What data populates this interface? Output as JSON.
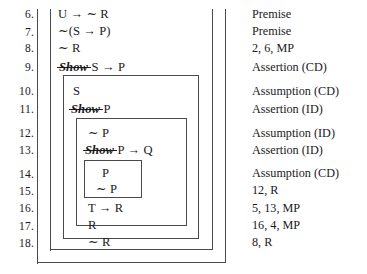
{
  "figure": {
    "ink_color": "#1a1a1a",
    "rule_color": "#4a4a4a"
  },
  "proof": {
    "lines": [
      {
        "number": "6.",
        "show": "",
        "formula": "U → ∼ R",
        "justification": "Premise"
      },
      {
        "number": "7.",
        "show": "",
        "formula": "∼(S → P)",
        "justification": "Premise"
      },
      {
        "number": "8.",
        "show": "",
        "formula": "∼ R",
        "justification": "2, 6, MP"
      },
      {
        "number": "9.",
        "show": "Show",
        "formula": "S → P",
        "justification": "Assertion (CD)"
      },
      {
        "number": "10.",
        "show": "",
        "formula": "S",
        "justification": "Assumption (CD)"
      },
      {
        "number": "11.",
        "show": "Show",
        "formula": "P",
        "justification": "Assertion (ID)"
      },
      {
        "number": "12.",
        "show": "",
        "formula": "∼ P",
        "justification": "Assumption (ID)"
      },
      {
        "number": "13.",
        "show": "Show",
        "formula": "P → Q",
        "justification": "Assertion (ID)"
      },
      {
        "number": "14.",
        "show": "",
        "formula": "P",
        "justification": "Assumption (CD)"
      },
      {
        "number": "15.",
        "show": "",
        "formula": "∼ P",
        "justification": "12, R"
      },
      {
        "number": "16.",
        "show": "",
        "formula": "T → R",
        "justification": "5, 13, MP"
      },
      {
        "number": "17.",
        "show": "",
        "formula": "R",
        "justification": "16, 4, MP"
      },
      {
        "number": "18.",
        "show": "",
        "formula": "∼ R",
        "justification": "8, R"
      }
    ]
  }
}
